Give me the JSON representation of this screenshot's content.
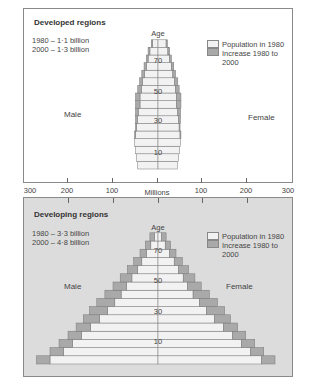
{
  "chart_data": [
    {
      "type": "bar",
      "subtype": "population-pyramid",
      "title": "Developed regions",
      "totals": [
        "1980 – 1·1 billion",
        "2000 – 1·3 billion"
      ],
      "xlabel": "Millions",
      "ylabel": "Age",
      "age_ticks": [
        "70",
        "50",
        "30",
        "10"
      ],
      "left_label": "Male",
      "right_label": "Female",
      "legend": [
        "Population in 1980",
        "Increase 1980 to 2000"
      ],
      "categories": [
        "0-4",
        "5-9",
        "10-14",
        "15-19",
        "20-24",
        "25-29",
        "30-34",
        "35-39",
        "40-44",
        "45-49",
        "50-54",
        "55-59",
        "60-64",
        "65-69",
        "70-74",
        "75-79",
        "80+"
      ],
      "series": [
        {
          "name": "Male 1980",
          "values": [
            45,
            48,
            50,
            52,
            50,
            48,
            46,
            44,
            40,
            40,
            37,
            34,
            30,
            26,
            22,
            18,
            12
          ]
        },
        {
          "name": "Male increase 1980 to 2000",
          "values": [
            0,
            0,
            0,
            0,
            2,
            2,
            4,
            6,
            10,
            10,
            8,
            7,
            6,
            5,
            4,
            4,
            3
          ]
        },
        {
          "name": "Female 1980",
          "values": [
            43,
            46,
            48,
            50,
            49,
            47,
            46,
            44,
            41,
            41,
            39,
            37,
            33,
            30,
            26,
            22,
            18
          ]
        },
        {
          "name": "Female increase 1980 to 2000",
          "values": [
            0,
            0,
            0,
            0,
            2,
            2,
            4,
            6,
            10,
            10,
            8,
            7,
            6,
            5,
            4,
            4,
            3
          ]
        }
      ],
      "xlim": [
        -300,
        300
      ]
    },
    {
      "type": "bar",
      "subtype": "population-pyramid",
      "title": "Developing regions",
      "totals": [
        "1980 – 3·3 billion",
        "2000 – 4·8 billion"
      ],
      "xlabel": "Millions",
      "ylabel": "Age",
      "age_ticks": [
        "70",
        "50",
        "30",
        "10"
      ],
      "left_label": "Male",
      "right_label": "Female",
      "legend": [
        "Population in 1980",
        "Increase 1980 to 2000"
      ],
      "categories": [
        "0-4",
        "5-9",
        "10-14",
        "15-19",
        "20-24",
        "25-29",
        "30-34",
        "35-39",
        "40-44",
        "45-49",
        "50-54",
        "55-59",
        "60-64",
        "65-69",
        "70-74",
        "75-79"
      ],
      "series": [
        {
          "name": "Male 1980",
          "values": [
            240,
            210,
            190,
            170,
            150,
            130,
            112,
            96,
            82,
            70,
            58,
            46,
            36,
            26,
            16,
            8
          ]
        },
        {
          "name": "Male increase 1980 to 2000",
          "values": [
            30,
            30,
            30,
            30,
            32,
            36,
            40,
            40,
            36,
            30,
            26,
            22,
            18,
            14,
            12,
            10
          ]
        },
        {
          "name": "Female 1980",
          "values": [
            230,
            205,
            185,
            165,
            145,
            125,
            108,
            92,
            78,
            66,
            56,
            46,
            36,
            26,
            16,
            8
          ]
        },
        {
          "name": "Female increase 1980 to 2000",
          "values": [
            30,
            30,
            30,
            30,
            32,
            36,
            40,
            40,
            36,
            30,
            26,
            22,
            18,
            14,
            12,
            10
          ]
        }
      ],
      "xlim": [
        -300,
        300
      ]
    }
  ],
  "axis": {
    "ticks": [
      "300",
      "200",
      "100",
      "Millions",
      "100",
      "200",
      "300"
    ]
  },
  "colors": {
    "base_fill": "#f2f2f2",
    "increase_fill": "#a9a9a9",
    "developing_bg": "#dcdcdc",
    "outline": "#777777"
  }
}
